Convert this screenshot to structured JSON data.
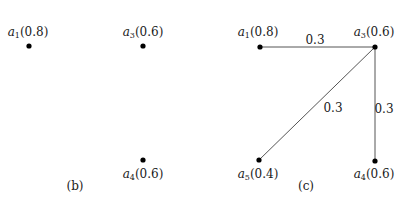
{
  "panels": [
    {
      "id": "b",
      "caption": "(b)",
      "caption_pos": [
        75,
        190
      ],
      "nodes": [
        {
          "name": "a",
          "sub": "1",
          "value": "(0.8)",
          "x": 29,
          "y": 46,
          "label_x": 28,
          "label_y": 36,
          "label_pos": "above"
        },
        {
          "name": "a",
          "sub": "3",
          "value": "(0.6)",
          "x": 143,
          "y": 46,
          "label_x": 143,
          "label_y": 36,
          "label_pos": "above"
        },
        {
          "name": "a",
          "sub": "4",
          "value": "(0.6)",
          "x": 143,
          "y": 160,
          "label_x": 143,
          "label_y": 178,
          "label_pos": "below"
        }
      ],
      "edges": []
    },
    {
      "id": "c",
      "caption": "(c)",
      "caption_pos": [
        306,
        190
      ],
      "nodes": [
        {
          "name": "a",
          "sub": "1",
          "value": "(0.8)",
          "x": 260,
          "y": 47,
          "label_x": 258,
          "label_y": 36,
          "label_pos": "above"
        },
        {
          "name": "a",
          "sub": "3",
          "value": "(0.6)",
          "x": 375,
          "y": 47,
          "label_x": 374,
          "label_y": 36,
          "label_pos": "above"
        },
        {
          "name": "a",
          "sub": "5",
          "value": "(0.4)",
          "x": 259,
          "y": 160,
          "label_x": 258,
          "label_y": 178,
          "label_pos": "below"
        },
        {
          "name": "a",
          "sub": "4",
          "value": "(0.6)",
          "x": 375,
          "y": 161,
          "label_x": 374,
          "label_y": 178,
          "label_pos": "below"
        }
      ],
      "edges": [
        {
          "from": "a1",
          "to": "a3",
          "x1": 260,
          "y1": 47,
          "x2": 375,
          "y2": 47,
          "weight": "0.3",
          "label_x": 315,
          "label_y": 44
        },
        {
          "from": "a3",
          "to": "a5",
          "x1": 375,
          "y1": 47,
          "x2": 259,
          "y2": 160,
          "weight": "0.3",
          "label_x": 333,
          "label_y": 112
        },
        {
          "from": "a3",
          "to": "a4",
          "x1": 375,
          "y1": 47,
          "x2": 375,
          "y2": 161,
          "weight": "0.3",
          "label_x": 384,
          "label_y": 113
        }
      ]
    }
  ]
}
